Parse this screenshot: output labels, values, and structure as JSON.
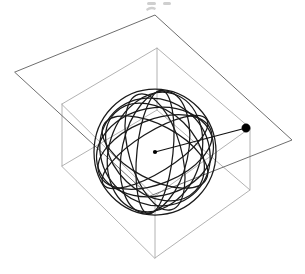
{
  "figure": {
    "title": "",
    "caption": "",
    "canvas": {
      "width": 305,
      "height": 274,
      "background": "#ffffff"
    }
  },
  "objects": {
    "plane": {
      "name": "cutting-plane",
      "kind": "quadrilateral",
      "stroke": "#6e6e6e",
      "stroke_width": 1.0,
      "vertices": [
        {
          "label": "left",
          "x": 15,
          "y": 72
        },
        {
          "label": "top",
          "x": 155,
          "y": 15
        },
        {
          "label": "right",
          "x": 292,
          "y": 140
        },
        {
          "label": "bottom",
          "x": 150,
          "y": 196
        }
      ]
    },
    "box": {
      "name": "bounding-box",
      "kind": "rectangular-prism",
      "stroke": "#a9a9a9",
      "stroke_width": 0.9,
      "front_face": [
        {
          "x": 62,
          "y": 104
        },
        {
          "x": 157,
          "y": 48
        },
        {
          "x": 250,
          "y": 128
        },
        {
          "x": 155,
          "y": 196
        }
      ],
      "depth_offset": {
        "dx": 0,
        "dy": 62
      },
      "vertices_top": [
        {
          "label": "top-back-left",
          "x": 62,
          "y": 104
        },
        {
          "label": "top-back-right",
          "x": 157,
          "y": 48
        },
        {
          "label": "top-front-right",
          "x": 250,
          "y": 128
        },
        {
          "label": "top-front-left",
          "x": 155,
          "y": 196
        }
      ],
      "vertices_bottom": [
        {
          "label": "bottom-back-left",
          "x": 62,
          "y": 166
        },
        {
          "label": "bottom-back-right",
          "x": 157,
          "y": 110
        },
        {
          "label": "bottom-front-right",
          "x": 250,
          "y": 190
        },
        {
          "label": "bottom-front-left",
          "x": 155,
          "y": 258
        }
      ]
    },
    "sphere": {
      "name": "great-circle-sphere",
      "kind": "sphere-wireframe",
      "stroke": "#1a1a1a",
      "stroke_width": 1.25,
      "center": {
        "x": 155,
        "y": 152
      },
      "screen_radius_x": 61,
      "screen_radius_y": 63,
      "great_circle_count": 9,
      "rendering": "overlapping rotated ellipses approximating great circles"
    },
    "radius_vector": {
      "name": "radius-segment",
      "kind": "line-segment",
      "stroke": "#111111",
      "from": {
        "label": "sphere-center",
        "x": 155,
        "y": 152
      },
      "to": {
        "label": "plane-point",
        "x": 246,
        "y": 128
      }
    },
    "center_marker": {
      "name": "center-dot",
      "x": 155,
      "y": 152,
      "radius": 2.1,
      "fill": "#000000"
    },
    "endpoint_marker": {
      "name": "endpoint-dot",
      "x": 246,
      "y": 128,
      "radius": 4.2,
      "fill": "#000000"
    }
  },
  "palette": {
    "background": "#ffffff",
    "box_line": "#a9a9a9",
    "plane_line": "#6e6e6e",
    "sphere_line": "#1a1a1a",
    "marker": "#000000"
  }
}
